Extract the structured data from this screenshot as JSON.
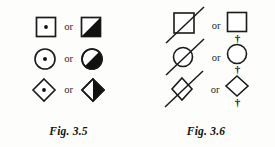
{
  "page": {
    "background_color": "#fdfdfc",
    "ink_color": "#1a1a1a",
    "width": 275,
    "height": 147
  },
  "figures": [
    {
      "id": "fig-3-5",
      "caption": "Fig. 3.5",
      "rows": [
        {
          "left_symbol": "square-with-center-dot",
          "connector": "or",
          "right_symbol": "square-half-filled-black"
        },
        {
          "left_symbol": "circle-with-center-dot",
          "connector": "or",
          "right_symbol": "circle-half-filled-black"
        },
        {
          "left_symbol": "diamond-with-center-dot",
          "connector": "or",
          "right_symbol": "diamond-half-filled-black"
        }
      ]
    },
    {
      "id": "fig-3-6",
      "caption": "Fig. 3.6",
      "rows": [
        {
          "left_symbol": "square-with-diagonal-slash",
          "connector": "or",
          "right_symbol": "square-plain-with-dagger-below"
        },
        {
          "left_symbol": "circle-with-diagonal-slash",
          "connector": "or",
          "right_symbol": "circle-plain-with-daggers"
        },
        {
          "left_symbol": "diamond-with-diagonal-slash",
          "connector": "or",
          "right_symbol": "diamond-plain-with-daggers"
        }
      ]
    }
  ],
  "glyphs": {
    "dagger": "†"
  },
  "colors": {
    "ink": "#1a1a1a",
    "fill_black": "#111111",
    "paper": "#fdfdfc"
  }
}
